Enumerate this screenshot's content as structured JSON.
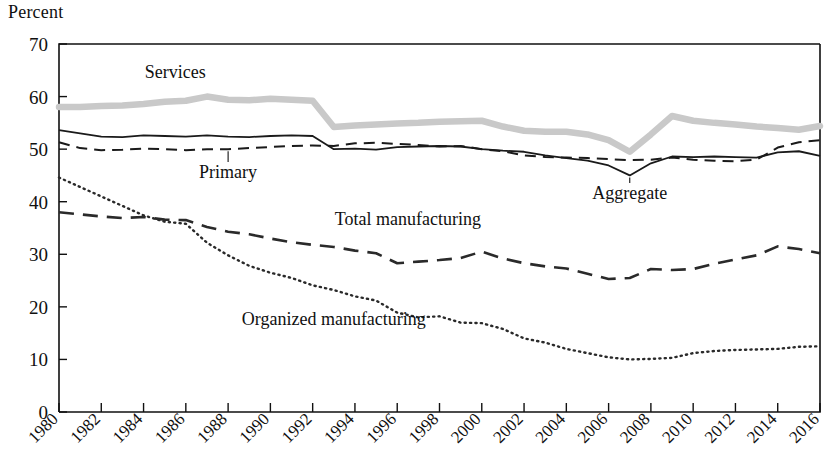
{
  "axis_title": "Percent",
  "chart_data": {
    "type": "line",
    "title": "",
    "subtitle": "",
    "xlabel": "",
    "ylabel": "Percent",
    "ylim": [
      0,
      70
    ],
    "xlim": [
      1980,
      2016
    ],
    "grid": false,
    "legend_position": "inline-labels",
    "y_ticks": [
      0,
      10,
      20,
      30,
      40,
      50,
      60,
      70
    ],
    "x_ticks": [
      1980,
      1982,
      1984,
      1986,
      1988,
      1990,
      1992,
      1994,
      1996,
      1998,
      2000,
      2002,
      2004,
      2006,
      2008,
      2010,
      2012,
      2014,
      2016
    ],
    "x": [
      1980,
      1981,
      1982,
      1983,
      1984,
      1985,
      1986,
      1987,
      1988,
      1989,
      1990,
      1991,
      1992,
      1993,
      1994,
      1995,
      1996,
      1997,
      1998,
      1999,
      2000,
      2001,
      2002,
      2003,
      2004,
      2005,
      2006,
      2007,
      2008,
      2009,
      2010,
      2011,
      2012,
      2013,
      2014,
      2015,
      2016
    ],
    "series": [
      {
        "name": "Services",
        "style": "thick-light-gray",
        "color": "#c9c9c9",
        "label_x": 1985.5,
        "label_y": 63.5,
        "values": [
          58.0,
          58.0,
          58.2,
          58.3,
          58.6,
          59.0,
          59.2,
          60.0,
          59.4,
          59.3,
          59.6,
          59.4,
          59.2,
          54.2,
          54.5,
          54.7,
          54.9,
          55.0,
          55.2,
          55.3,
          55.4,
          54.3,
          53.5,
          53.3,
          53.3,
          52.8,
          51.7,
          49.5,
          52.8,
          56.3,
          55.4,
          55.0,
          54.7,
          54.3,
          54.0,
          53.7,
          54.4
        ]
      },
      {
        "name": "Aggregate",
        "style": "solid-black",
        "color": "#1a1a1a",
        "label_x": 2007.0,
        "label_y": 40.5,
        "leader": true,
        "values": [
          53.6,
          53.0,
          52.4,
          52.3,
          52.6,
          52.5,
          52.4,
          52.6,
          52.4,
          52.3,
          52.5,
          52.6,
          52.5,
          50.0,
          50.1,
          49.9,
          50.4,
          50.5,
          50.6,
          50.5,
          50.0,
          49.7,
          49.5,
          48.8,
          48.3,
          47.8,
          46.9,
          45.0,
          47.3,
          48.6,
          48.5,
          48.6,
          48.5,
          48.4,
          49.4,
          49.6,
          48.7
        ]
      },
      {
        "name": "Primary",
        "style": "short-dash",
        "color": "#1a1a1a",
        "label_x": 1988.0,
        "label_y": 44.5,
        "leader": true,
        "values": [
          51.3,
          50.2,
          49.8,
          49.9,
          50.1,
          50.0,
          49.8,
          50.0,
          50.0,
          50.2,
          50.4,
          50.6,
          50.7,
          50.6,
          51.1,
          51.2,
          51.0,
          50.8,
          50.5,
          50.6,
          50.0,
          49.6,
          48.8,
          48.5,
          48.4,
          48.3,
          48.1,
          47.9,
          48.0,
          48.4,
          48.0,
          47.8,
          47.7,
          48.0,
          50.3,
          51.3,
          51.7
        ]
      },
      {
        "name": "Total manufacturing",
        "style": "long-dash",
        "color": "#2a2a2a",
        "label_x": 1996.5,
        "label_y": 35.5,
        "values": [
          38.0,
          37.6,
          37.2,
          36.9,
          37.1,
          36.6,
          36.5,
          35.2,
          34.3,
          33.8,
          33.0,
          32.3,
          31.8,
          31.4,
          30.7,
          30.2,
          28.3,
          28.6,
          28.9,
          29.3,
          30.5,
          29.2,
          28.3,
          27.7,
          27.3,
          26.3,
          25.3,
          25.5,
          27.2,
          27.0,
          27.2,
          28.2,
          29.0,
          29.8,
          31.5,
          31.0,
          30.2
        ]
      },
      {
        "name": "Organized manufacturing",
        "style": "dotted",
        "color": "#2a2a2a",
        "label_x": 1993.0,
        "label_y": 16.5,
        "values": [
          44.6,
          42.8,
          41.0,
          39.2,
          37.4,
          36.2,
          35.8,
          32.2,
          29.8,
          27.8,
          26.5,
          25.5,
          24.1,
          23.2,
          22.0,
          21.2,
          18.9,
          18.0,
          18.2,
          17.0,
          16.9,
          15.8,
          14.0,
          13.2,
          12.0,
          11.2,
          10.4,
          10.0,
          10.1,
          10.3,
          11.2,
          11.6,
          11.8,
          11.9,
          12.0,
          12.4,
          12.5
        ]
      }
    ]
  }
}
